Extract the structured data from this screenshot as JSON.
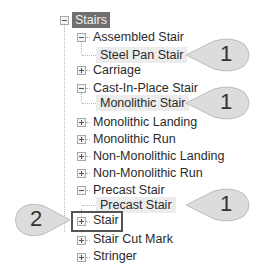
{
  "tree": {
    "root": {
      "label": "Stairs",
      "state": "expanded",
      "selected": true
    },
    "items": [
      {
        "label": "Assembled Stair",
        "state": "expanded",
        "level": 1,
        "children": [
          {
            "label": "Steel Pan Stair",
            "highlighted": true
          }
        ]
      },
      {
        "label": "Carriage",
        "state": "collapsed",
        "level": 1
      },
      {
        "label": "Cast-In-Place Stair",
        "state": "expanded",
        "level": 1,
        "children": [
          {
            "label": "Monolithic Stair",
            "highlighted": true
          }
        ]
      },
      {
        "label": "Monolithic Landing",
        "state": "collapsed",
        "level": 1
      },
      {
        "label": "Monolithic Run",
        "state": "collapsed",
        "level": 1
      },
      {
        "label": "Non-Monolithic Landing",
        "state": "collapsed",
        "level": 1
      },
      {
        "label": "Non-Monolithic Run",
        "state": "collapsed",
        "level": 1
      },
      {
        "label": "Precast Stair",
        "state": "expanded",
        "level": 1,
        "children": [
          {
            "label": "Precast Stair",
            "highlighted": true
          }
        ]
      },
      {
        "label": "Stair",
        "state": "collapsed",
        "level": 1,
        "boxed": true
      },
      {
        "label": "Stair Cut Mark",
        "state": "collapsed",
        "level": 1
      },
      {
        "label": "Stringer",
        "state": "collapsed",
        "level": 1
      }
    ]
  },
  "callouts": [
    {
      "number": "1",
      "target": "Steel Pan Stair"
    },
    {
      "number": "1",
      "target": "Monolithic Stair"
    },
    {
      "number": "1",
      "target": "Precast Stair"
    },
    {
      "number": "2",
      "target": "Stair"
    }
  ],
  "colors": {
    "selected_bg": "#6f6f6f",
    "highlight_bg": "#ececec",
    "callout_fill": "#dcdcdc",
    "box_border": "#555555"
  }
}
